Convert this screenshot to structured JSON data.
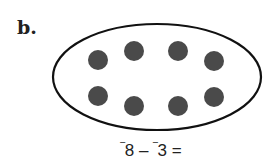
{
  "problem": {
    "label": "b.",
    "equation": {
      "neg_sign_1": "‾",
      "a": "8",
      "op": " – ",
      "neg_sign_2": "‾",
      "b": "3",
      "eq": " ="
    },
    "dots": {
      "count": 8,
      "color": "#4a4a4a"
    }
  }
}
